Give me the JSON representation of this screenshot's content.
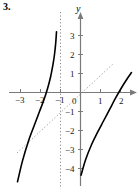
{
  "figure": {
    "problem_number": "3.",
    "axis_labels": {
      "y": "y"
    },
    "background_color": "#ffffff",
    "curve_color": "#000000",
    "axis_color": "#7a7a7a",
    "asymptote_color": "#8a8a8a",
    "identity_line_color": "#9a9a9a"
  },
  "chart_data": {
    "type": "line",
    "title": "",
    "xlabel": "",
    "ylabel": "y",
    "xlim": [
      -3.8,
      2.6
    ],
    "ylim": [
      -4.6,
      3.5
    ],
    "grid": false,
    "legend": null,
    "x_ticks": [
      -3,
      -2,
      -1,
      0,
      1,
      2
    ],
    "x_tick_labels": [
      "−3",
      "−2",
      "−1",
      "0",
      "1",
      "2"
    ],
    "y_ticks": [
      3,
      2,
      1,
      -1,
      -2,
      -3,
      -4
    ],
    "y_tick_labels": [
      "3",
      "2",
      "1",
      "−1",
      "−2",
      "−3",
      "−4"
    ],
    "annotations": [
      {
        "name": "vertical-asymptote",
        "type": "vertical-line",
        "x": -1,
        "style": "dotted"
      },
      {
        "name": "identity-line",
        "type": "line",
        "equation": "y = x",
        "style": "dotted",
        "x_range": [
          -3.2,
          1.75
        ]
      }
    ],
    "series": [
      {
        "name": "left-branch",
        "style": "solid",
        "x": [
          -3.15,
          -2.9,
          -2.6,
          -2.3,
          -2.05,
          -1.85,
          -1.65,
          -1.5,
          -1.38,
          -1.3,
          -1.24,
          -1.2
        ],
        "y": [
          -4.7,
          -3.6,
          -2.55,
          -1.7,
          -1.0,
          -0.45,
          0.2,
          0.8,
          1.45,
          2.0,
          2.6,
          3.2
        ]
      },
      {
        "name": "right-branch",
        "style": "solid",
        "x": [
          0.03,
          0.25,
          0.55,
          0.85,
          1.15,
          1.45,
          1.75,
          2.05,
          2.35,
          2.55
        ],
        "y": [
          -4.35,
          -3.55,
          -2.75,
          -2.1,
          -1.5,
          -0.9,
          -0.3,
          0.25,
          0.75,
          1.05
        ]
      }
    ]
  }
}
